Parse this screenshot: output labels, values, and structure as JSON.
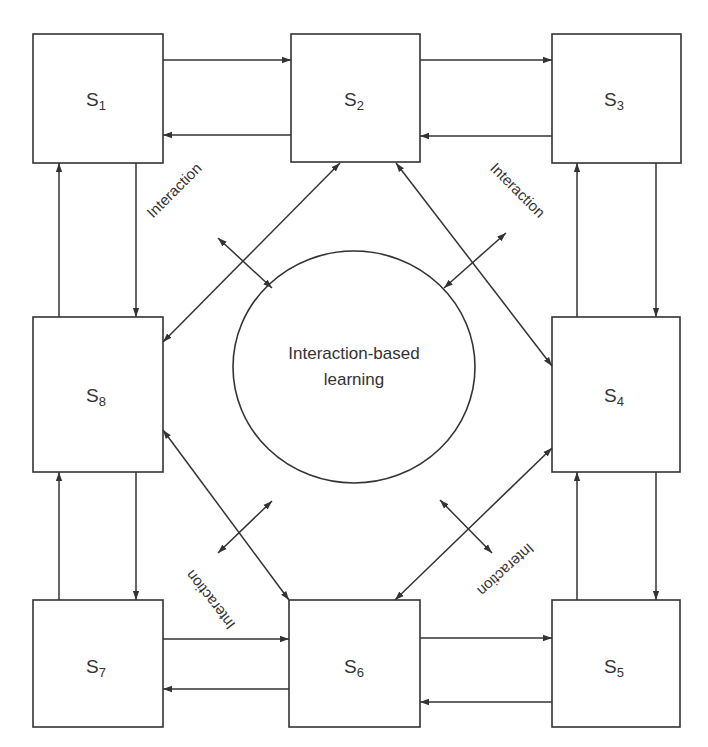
{
  "diagram": {
    "center": {
      "line1": "Interaction-based",
      "line2": "learning"
    },
    "nodes": [
      {
        "id": "s1",
        "letter": "S",
        "sub": "1"
      },
      {
        "id": "s2",
        "letter": "S",
        "sub": "2"
      },
      {
        "id": "s3",
        "letter": "S",
        "sub": "3"
      },
      {
        "id": "s4",
        "letter": "S",
        "sub": "4"
      },
      {
        "id": "s5",
        "letter": "S",
        "sub": "5"
      },
      {
        "id": "s6",
        "letter": "S",
        "sub": "6"
      },
      {
        "id": "s7",
        "letter": "S",
        "sub": "7"
      },
      {
        "id": "s8",
        "letter": "S",
        "sub": "8"
      }
    ],
    "interaction_labels": [
      "Interaction",
      "Interaction",
      "Interaction",
      "Interaction"
    ],
    "colors": {
      "stroke": "#333333",
      "background": "#ffffff",
      "text": "#333333"
    }
  }
}
